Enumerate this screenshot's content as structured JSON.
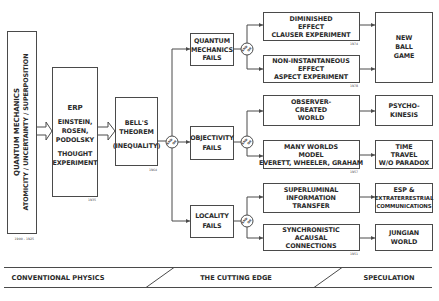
{
  "diagram": {
    "root": {
      "line1": "QUANTUM MECHANICS",
      "line2": "ATOMICITY / UNCERTAINTY / SUPERPOSITION",
      "year": "1900 - 1925"
    },
    "erp": {
      "lines": [
        "ERP",
        "EINSTEIN,",
        "ROSEN,",
        "PODOLSKY",
        "THOUGHT",
        "EXPERIMENT"
      ],
      "year": "1935"
    },
    "bell": {
      "lines": [
        "BELL'S",
        "THEOREM",
        "(INEQUALITY)"
      ],
      "year": "1964"
    },
    "junction_label": [
      "AND",
      "OR"
    ],
    "failures": [
      {
        "lines": [
          "QUANTUM",
          "MECHANICS",
          "FAILS"
        ]
      },
      {
        "lines": [
          "OBJECTIVITY",
          "FAILS"
        ]
      },
      {
        "lines": [
          "LOCALITY",
          "FAILS"
        ]
      }
    ],
    "outcomes": [
      {
        "lines": [
          "DIMINISHED",
          "EFFECT",
          "CLAUSER EXPERIMENT"
        ],
        "year": "1974"
      },
      {
        "lines": [
          "NON-INSTANTANEOUS",
          "EFFECT",
          "ASPECT EXPERIMENT"
        ],
        "year": "1978"
      },
      {
        "lines": [
          "OBSERVER-",
          "CREATED",
          "WORLD"
        ],
        "year": ""
      },
      {
        "lines": [
          "MANY WORLDS",
          "MODEL",
          "EVERETT, WHEELER, GRAHAM"
        ],
        "year": "1957"
      },
      {
        "lines": [
          "SUPERLUMINAL",
          "INFORMATION",
          "TRANSFER"
        ],
        "year": ""
      },
      {
        "lines": [
          "SYNCHRONISTIC",
          "ACAUSAL",
          "CONNECTIONS"
        ],
        "year": "1951"
      }
    ],
    "speculations": [
      {
        "lines": [
          "NEW",
          "BALL",
          "GAME"
        ]
      },
      {
        "lines": [
          "PSYCHO-",
          "KINESIS"
        ]
      },
      {
        "lines": [
          "TIME",
          "TRAVEL",
          "W/O PARADOX"
        ]
      },
      {
        "lines": [
          "ESP &",
          "EXTRATERRESTRIAL",
          "COMMUNICATIONS"
        ]
      },
      {
        "lines": [
          "JUNGIAN",
          "WORLD"
        ]
      }
    ]
  },
  "bands": {
    "conventional": "CONVENTIONAL PHYSICS",
    "cutting_edge": "THE CUTTING EDGE",
    "speculation": "SPECULATION"
  }
}
